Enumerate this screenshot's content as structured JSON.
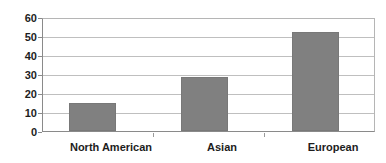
{
  "chart_data": {
    "type": "bar",
    "title": "",
    "xlabel": "",
    "ylabel": "",
    "categories": [
      "North American",
      "Asian",
      "European"
    ],
    "values": [
      15,
      29,
      53
    ],
    "ylim": [
      0,
      60
    ],
    "yticks": [
      0,
      10,
      20,
      30,
      40,
      50,
      60
    ],
    "ytick_labels": [
      "0",
      "10",
      "20",
      "30",
      "40",
      "50",
      "60"
    ],
    "grid": true,
    "grid_axis": "y",
    "legend": false,
    "legend_position": "none",
    "orientation": "vertical",
    "series": [
      {
        "name": "",
        "values": [
          15,
          29,
          53
        ]
      }
    ]
  },
  "style": {
    "bar_color": "#808080",
    "bar_edge_color": "#787878",
    "gridline_color": "#bfbfbf",
    "axis_color": "#8a8a8a",
    "plot_border_color": "#b5b5b5",
    "text_color": "#1d1d1d",
    "background_color": "#ffffff"
  }
}
